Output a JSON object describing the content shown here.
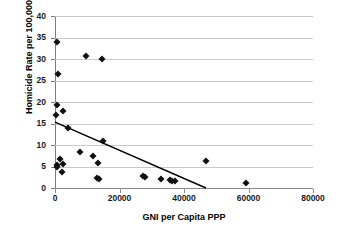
{
  "chart_data": {
    "type": "scatter",
    "title": "",
    "xlabel": "GNI per Capita PPP",
    "ylabel": "Homicide Rate per 100,000",
    "xlim": [
      0,
      80000
    ],
    "ylim": [
      0,
      40
    ],
    "xticks": [
      0,
      20000,
      40000,
      60000,
      80000
    ],
    "yticks": [
      0,
      5,
      10,
      15,
      20,
      25,
      30,
      35,
      40
    ],
    "xtick_labels": [
      "0",
      "20000",
      "40000",
      "60000",
      "80000"
    ],
    "ytick_labels": [
      "0",
      "5",
      "10",
      "15",
      "20",
      "25",
      "30",
      "35",
      "40"
    ],
    "grid": "horizontal",
    "legend": "none",
    "marker": "diamond",
    "marker_color": "#111111",
    "gridline_color": "#c8c8c8",
    "axis_color": "#7d7d7d",
    "background_color": "#ffffff",
    "points": [
      {
        "x": 700,
        "y": 34.0
      },
      {
        "x": 9700,
        "y": 30.8
      },
      {
        "x": 14500,
        "y": 29.9
      },
      {
        "x": 900,
        "y": 26.6
      },
      {
        "x": 600,
        "y": 19.3
      },
      {
        "x": 2600,
        "y": 17.8
      },
      {
        "x": 400,
        "y": 16.9
      },
      {
        "x": 3900,
        "y": 13.9
      },
      {
        "x": 15000,
        "y": 11.0
      },
      {
        "x": 7800,
        "y": 8.3
      },
      {
        "x": 11900,
        "y": 7.4
      },
      {
        "x": 1700,
        "y": 6.7
      },
      {
        "x": 46800,
        "y": 6.3
      },
      {
        "x": 13200,
        "y": 5.7
      },
      {
        "x": 2500,
        "y": 5.5
      },
      {
        "x": 700,
        "y": 5.3
      },
      {
        "x": 600,
        "y": 4.9
      },
      {
        "x": 2300,
        "y": 3.8
      },
      {
        "x": 27400,
        "y": 2.8
      },
      {
        "x": 28000,
        "y": 2.6
      },
      {
        "x": 13100,
        "y": 2.4
      },
      {
        "x": 13500,
        "y": 2.1
      },
      {
        "x": 32900,
        "y": 2.1
      },
      {
        "x": 35700,
        "y": 1.8
      },
      {
        "x": 36300,
        "y": 1.7
      },
      {
        "x": 37300,
        "y": 1.6
      },
      {
        "x": 59100,
        "y": 1.2
      }
    ],
    "trendline": {
      "type": "linear",
      "color": "#000000",
      "x_start": 0,
      "y_start": 15.3,
      "x_end": 46800,
      "y_end": 0.0
    }
  }
}
